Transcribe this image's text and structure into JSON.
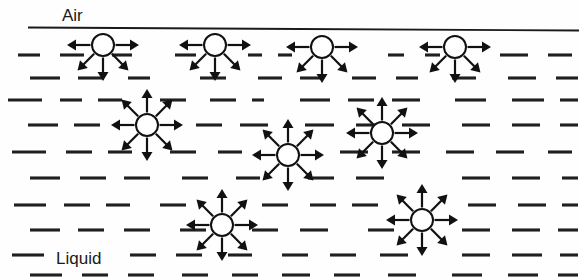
{
  "figure": {
    "width": 579,
    "height": 280,
    "background_color": "#fefefe",
    "ink_color": "#111111"
  },
  "labels": {
    "air": {
      "text": "Air",
      "x": 62,
      "y": 21,
      "font_size": 17
    },
    "liquid": {
      "text": "Liquid",
      "x": 56,
      "y": 264,
      "font_size": 17
    }
  },
  "interface": {
    "name": "air-liquid-interface-line",
    "x1": 28,
    "y1": 27.5,
    "x2": 579,
    "y2": 30.5,
    "color": "#1a1a1a",
    "width": 1.9
  },
  "molecule_style": {
    "radius": 11,
    "fill": "#ffffff",
    "stroke": "#111111",
    "stroke_width": 2.0,
    "arrow_length": 25,
    "arrow_head_length": 9,
    "arrow_head_half_width": 5.5
  },
  "surface_molecules": [
    {
      "id": "surface-molecule-1",
      "cx": 103,
      "cy": 45,
      "directions": [
        180,
        0,
        135,
        45,
        90
      ]
    },
    {
      "id": "surface-molecule-2",
      "cx": 215,
      "cy": 45,
      "directions": [
        180,
        0,
        135,
        45,
        90
      ]
    },
    {
      "id": "surface-molecule-3",
      "cx": 322,
      "cy": 47,
      "directions": [
        180,
        0,
        135,
        45,
        90
      ]
    },
    {
      "id": "surface-molecule-4",
      "cx": 455,
      "cy": 47,
      "directions": [
        180,
        0,
        135,
        45,
        90
      ]
    }
  ],
  "interior_molecules": [
    {
      "id": "interior-molecule-1",
      "cx": 147,
      "cy": 125,
      "directions": [
        0,
        45,
        90,
        135,
        180,
        225,
        270,
        315
      ]
    },
    {
      "id": "interior-molecule-2",
      "cx": 382,
      "cy": 133,
      "directions": [
        0,
        45,
        90,
        135,
        180,
        225,
        270,
        315
      ]
    },
    {
      "id": "interior-molecule-3",
      "cx": 288,
      "cy": 155,
      "directions": [
        0,
        45,
        90,
        135,
        180,
        225,
        270,
        315
      ]
    },
    {
      "id": "interior-molecule-4",
      "cx": 422,
      "cy": 220,
      "directions": [
        0,
        45,
        90,
        135,
        180,
        225,
        270,
        315
      ]
    },
    {
      "id": "interior-molecule-5",
      "cx": 222,
      "cy": 225,
      "directions": [
        0,
        45,
        90,
        135,
        180,
        225,
        270,
        315
      ]
    }
  ],
  "liquid_rows": [
    {
      "y": 55,
      "dashes": [
        [
          18,
          40
        ],
        [
          60,
          84
        ],
        [
          112,
          132
        ],
        [
          175,
          196
        ],
        [
          248,
          262
        ],
        [
          278,
          292
        ],
        [
          388,
          404
        ],
        [
          425,
          440
        ],
        [
          500,
          528
        ],
        [
          548,
          572
        ]
      ]
    },
    {
      "y": 78,
      "dashes": [
        [
          30,
          60
        ],
        [
          78,
          104
        ],
        [
          128,
          150
        ],
        [
          200,
          226
        ],
        [
          258,
          282
        ],
        [
          300,
          322
        ],
        [
          352,
          376
        ],
        [
          396,
          418
        ],
        [
          452,
          476
        ],
        [
          508,
          536
        ],
        [
          556,
          578
        ]
      ]
    },
    {
      "y": 100,
      "dashes": [
        [
          8,
          42
        ],
        [
          60,
          82
        ],
        [
          98,
          122
        ],
        [
          160,
          186
        ],
        [
          210,
          236
        ],
        [
          252,
          264
        ],
        [
          300,
          330
        ],
        [
          348,
          374
        ],
        [
          392,
          420
        ],
        [
          455,
          486
        ],
        [
          512,
          544
        ],
        [
          560,
          578
        ]
      ]
    },
    {
      "y": 125,
      "dashes": [
        [
          28,
          58
        ],
        [
          74,
          100
        ],
        [
          196,
          222
        ],
        [
          240,
          268
        ],
        [
          305,
          334
        ],
        [
          356,
          382
        ],
        [
          402,
          430
        ],
        [
          462,
          490
        ],
        [
          512,
          540
        ],
        [
          560,
          578
        ]
      ]
    },
    {
      "y": 152,
      "dashes": [
        [
          12,
          46
        ],
        [
          66,
          92
        ],
        [
          108,
          132
        ],
        [
          170,
          196
        ],
        [
          218,
          242
        ],
        [
          340,
          368
        ],
        [
          392,
          420
        ],
        [
          446,
          474
        ],
        [
          496,
          524
        ],
        [
          548,
          572
        ]
      ]
    },
    {
      "y": 178,
      "dashes": [
        [
          30,
          60
        ],
        [
          80,
          106
        ],
        [
          124,
          150
        ],
        [
          182,
          208
        ],
        [
          236,
          260
        ],
        [
          308,
          334
        ],
        [
          356,
          384
        ],
        [
          462,
          490
        ],
        [
          512,
          540
        ],
        [
          562,
          578
        ]
      ]
    },
    {
      "y": 205,
      "dashes": [
        [
          14,
          46
        ],
        [
          64,
          90
        ],
        [
          106,
          130
        ],
        [
          160,
          186
        ],
        [
          262,
          288
        ],
        [
          310,
          336
        ],
        [
          352,
          378
        ],
        [
          468,
          496
        ],
        [
          518,
          546
        ],
        [
          562,
          578
        ]
      ]
    },
    {
      "y": 230,
      "dashes": [
        [
          30,
          60
        ],
        [
          78,
          104
        ],
        [
          124,
          150
        ],
        [
          180,
          206
        ],
        [
          252,
          278
        ],
        [
          300,
          328
        ],
        [
          368,
          394
        ],
        [
          462,
          490
        ],
        [
          512,
          540
        ],
        [
          558,
          578
        ]
      ]
    },
    {
      "y": 255,
      "dashes": [
        [
          12,
          44
        ],
        [
          130,
          156
        ],
        [
          176,
          202
        ],
        [
          228,
          252
        ],
        [
          282,
          308
        ],
        [
          330,
          356
        ],
        [
          380,
          408
        ],
        [
          462,
          490
        ],
        [
          512,
          542
        ],
        [
          560,
          578
        ]
      ]
    },
    {
      "y": 275,
      "dashes": [
        [
          30,
          62
        ],
        [
          82,
          108
        ],
        [
          128,
          154
        ],
        [
          182,
          208
        ],
        [
          232,
          258
        ],
        [
          282,
          310
        ],
        [
          334,
          360
        ],
        [
          388,
          416
        ],
        [
          452,
          482
        ],
        [
          508,
          538
        ],
        [
          558,
          578
        ]
      ]
    }
  ]
}
